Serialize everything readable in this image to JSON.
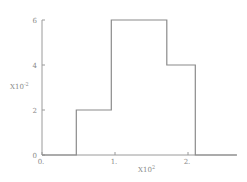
{
  "chart_data": {
    "type": "line",
    "subtype": "step",
    "title": "",
    "xlabel": "",
    "ylabel": "",
    "x_multiplier_label": "X10",
    "x_multiplier_exp": "2",
    "y_multiplier_label": "X10",
    "y_multiplier_exp": "-2",
    "xlim": [
      0,
      2.67
    ],
    "ylim": [
      0,
      6
    ],
    "x_ticks": [
      {
        "value": 0,
        "label": "0."
      },
      {
        "value": 1,
        "label": "1."
      },
      {
        "value": 2,
        "label": "2."
      }
    ],
    "y_ticks": [
      {
        "value": 0,
        "label": "0"
      },
      {
        "value": 2,
        "label": "2"
      },
      {
        "value": 4,
        "label": "4"
      },
      {
        "value": 6,
        "label": "6"
      }
    ],
    "grid": false,
    "legend": null,
    "series": [
      {
        "name": "step",
        "color": "#8a8a8a",
        "points": [
          {
            "x": 0.0,
            "y": 0
          },
          {
            "x": 0.47,
            "y": 0
          },
          {
            "x": 0.47,
            "y": 2
          },
          {
            "x": 0.95,
            "y": 2
          },
          {
            "x": 0.95,
            "y": 6
          },
          {
            "x": 1.71,
            "y": 6
          },
          {
            "x": 1.71,
            "y": 4
          },
          {
            "x": 2.1,
            "y": 4
          },
          {
            "x": 2.1,
            "y": 0
          },
          {
            "x": 2.67,
            "y": 0
          }
        ]
      }
    ]
  },
  "layout": {
    "origin_px": [
      42,
      155
    ],
    "x_px_per_unit": 73,
    "y_px_per_unit": 22.5
  }
}
